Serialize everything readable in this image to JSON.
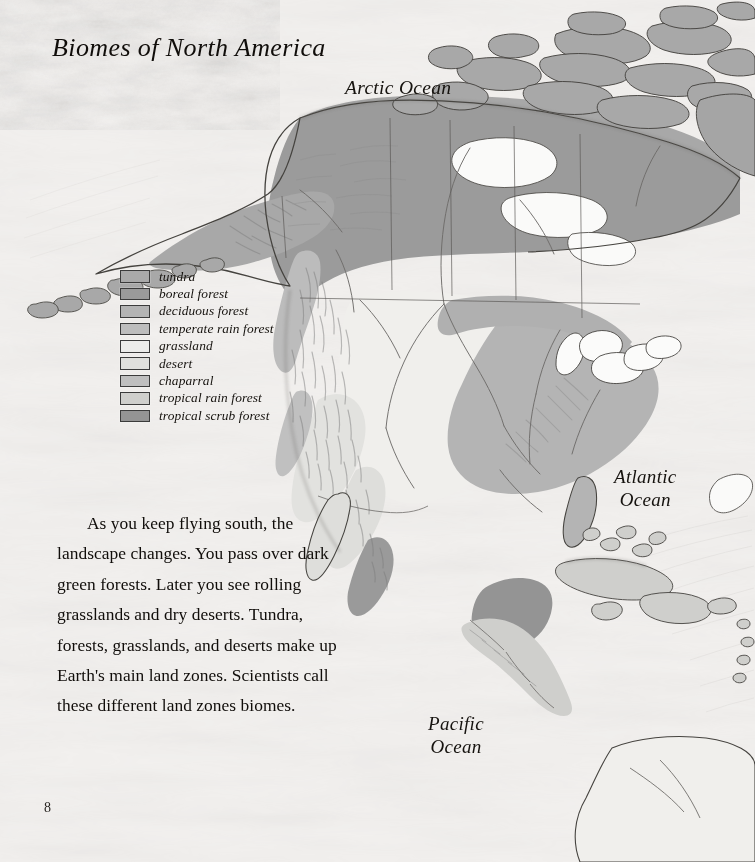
{
  "page": {
    "title": "Biomes of North America",
    "page_number": "8",
    "body_text": "As you keep flying south, the landscape changes.  You pass over dark green forests.  Later you see rolling grasslands and dry deserts.  Tundra, forests, grasslands, and deserts make up Earth's main land zones.  Scientists call these different land zones biomes."
  },
  "map": {
    "ocean_labels": [
      {
        "name": "arctic-ocean",
        "text": "Arctic Ocean"
      },
      {
        "name": "atlantic-ocean",
        "text": "Atlantic\nOcean"
      },
      {
        "name": "pacific-ocean",
        "text": "Pacific\nOcean"
      }
    ],
    "legend": {
      "items": [
        {
          "label": "tundra",
          "color": "#a9a9a9"
        },
        {
          "label": "boreal forest",
          "color": "#9a9a9a"
        },
        {
          "label": "deciduous forest",
          "color": "#b4b4b4"
        },
        {
          "label": "temperate rain forest",
          "color": "#bdbdbd"
        },
        {
          "label": "grassland",
          "color": "#ececea"
        },
        {
          "label": "desert",
          "color": "#e0e0dd"
        },
        {
          "label": "chaparral",
          "color": "#bfbfbf"
        },
        {
          "label": "tropical rain forest",
          "color": "#cfcfcc"
        },
        {
          "label": "tropical scrub forest",
          "color": "#949494"
        }
      ]
    },
    "colors": {
      "paper": "#efedea",
      "outline": "#4a4845",
      "tundra": "#a9a9a9",
      "boreal_forest": "#9a9a9a",
      "deciduous_forest": "#b4b4b4",
      "temperate_rain_forest": "#bdbdbd",
      "grassland": "#ececea",
      "desert": "#e0e0dd",
      "chaparral": "#bfbfbf",
      "tropical_rain_forest": "#cfcfcc",
      "tropical_scrub_forest": "#949494",
      "water": "#fbfbfa"
    }
  }
}
